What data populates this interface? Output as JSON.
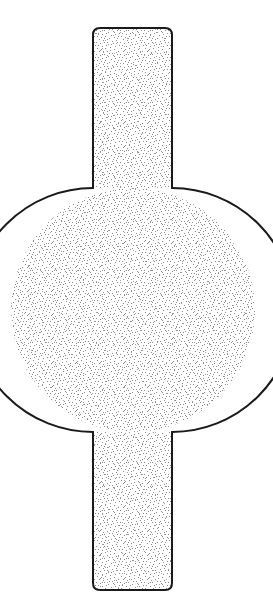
{
  "figure": {
    "kind": "technical-line-drawing",
    "title": "",
    "caption": "",
    "canvas": {
      "width": 273,
      "height": 616,
      "background_color": "#ffffff"
    },
    "style": {
      "outline_color": "#1a1a1a",
      "outline_width": 2,
      "fill_base_color": "#ffffff",
      "stipple_color": "#8c8c8c",
      "stipple_density": "fine-random",
      "shading_technique": "stipple"
    },
    "geometry": {
      "body": {
        "shape": "circle",
        "center_x": 133,
        "center_y": 310,
        "radius": 122,
        "left_extent": 11,
        "right_extent": 255,
        "top_extent": 188,
        "bottom_extent": 432
      },
      "top_neck": {
        "shape": "rounded-rectangle",
        "left": 93,
        "right": 172,
        "top": 28,
        "bottom": 190,
        "width": 79,
        "height": 162,
        "corner_radius_top": 7,
        "corner_radius_bottom": 0
      },
      "bottom_neck": {
        "shape": "rounded-rectangle",
        "left": 93,
        "right": 172,
        "top": 430,
        "bottom": 590,
        "width": 79,
        "height": 160,
        "corner_radius_top": 0,
        "corner_radius_bottom": 7
      }
    },
    "parts": [
      {
        "name": "top-neck",
        "label": ""
      },
      {
        "name": "circular-body",
        "label": ""
      },
      {
        "name": "bottom-neck",
        "label": ""
      }
    ]
  }
}
